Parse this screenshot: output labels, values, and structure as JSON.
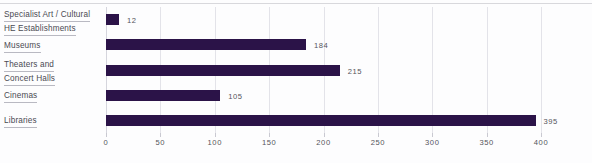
{
  "chart_data": {
    "type": "bar",
    "orientation": "horizontal",
    "title": "",
    "subtitle": "",
    "xlabel": "",
    "ylabel": "",
    "categories": [
      "Specialist Art / Cultural HE Establishments",
      "Museums",
      "Theaters and Concert Halls",
      "Cinemas",
      "Libraries"
    ],
    "values": [
      12,
      184,
      215,
      105,
      395
    ],
    "value_labels": [
      "12",
      "184",
      "215",
      "105",
      "395"
    ],
    "xlim": [
      0,
      400
    ],
    "xticks": [
      0,
      50,
      100,
      150,
      200,
      250,
      300,
      350,
      400
    ],
    "xtick_labels": [
      "0",
      "50",
      "100",
      "150",
      "200",
      "250",
      "300",
      "350",
      "400"
    ],
    "grid": true,
    "grid_axis": "x",
    "legend": false,
    "bar_color": "#2b1348",
    "gridline_color": "#e3e3e9",
    "text_color": "#54545c"
  },
  "category_lines": [
    [
      "Specialist Art / Cultural",
      "HE Establishments"
    ],
    [
      "Museums"
    ],
    [
      "Theaters and",
      "Concert Halls"
    ],
    [
      "Cinemas"
    ],
    [
      "Libraries"
    ]
  ]
}
